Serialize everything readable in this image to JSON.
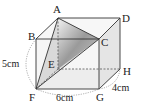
{
  "figure": {
    "type": "cuboid-with-triangular-pyramid",
    "vertices": {
      "A": "A",
      "B": "B",
      "C": "C",
      "D": "D",
      "E": "E",
      "F": "F",
      "G": "G",
      "H": "H"
    },
    "dimensions": {
      "height": "5 cm",
      "width": "6 cm",
      "depth": "4 cm"
    },
    "shaded_solid": "A-EFC",
    "colors": {
      "edge": "#333333",
      "face_fill": "#e6e6e6",
      "shade_dark": "#8c8c8c",
      "shade_light": "#d9d9d9",
      "dash": "#555555"
    }
  }
}
